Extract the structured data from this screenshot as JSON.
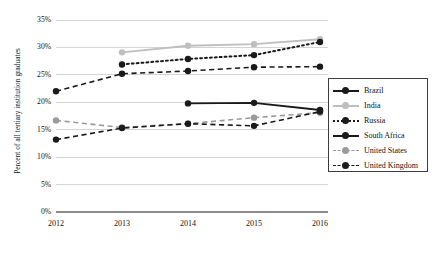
{
  "chart_data": {
    "type": "line",
    "title": "",
    "xlabel": "",
    "ylabel": "Percent of all tertiary institution graduates",
    "categories": [
      "2012",
      "2013",
      "2014",
      "2015",
      "2016"
    ],
    "ylim": [
      0,
      35
    ],
    "ytick_labels": [
      "0%",
      "5%",
      "10%",
      "15%",
      "20%",
      "25%",
      "30%",
      "35%"
    ],
    "ytick_values": [
      0,
      5,
      10,
      15,
      20,
      25,
      30,
      35
    ],
    "grid": true,
    "legend_position": "right",
    "series": [
      {
        "name": "Brazil",
        "color": "#1a1a1a",
        "style": "solid",
        "values": [
          null,
          null,
          null,
          null,
          18.5
        ]
      },
      {
        "name": "India",
        "color": "#bfbfbf",
        "style": "solid",
        "values": [
          null,
          29.1,
          30.3,
          30.6,
          31.5
        ]
      },
      {
        "name": "Russia",
        "color": "#1a1a1a",
        "style": "dotted",
        "values": [
          null,
          26.9,
          27.9,
          28.6,
          31.0
        ]
      },
      {
        "name": "South Africa",
        "color": "#1a1a1a",
        "style": "solid",
        "values": [
          null,
          null,
          19.8,
          19.9,
          18.6
        ]
      },
      {
        "name": "United States",
        "color": "#9a9a9a",
        "style": "dashed",
        "values": [
          16.7,
          15.4,
          16.1,
          17.2,
          18.1
        ]
      },
      {
        "name": "United Kingdom",
        "color": "#1a1a1a",
        "style": "dashed",
        "values": [
          22.0,
          25.2,
          25.7,
          26.4,
          26.5
        ]
      }
    ],
    "ukline2": {
      "name": "United Kingdom lower",
      "values": [
        13.2,
        15.3,
        16.1,
        15.7,
        18.3
      ]
    }
  },
  "legend": {
    "items": [
      {
        "label": "Brazil"
      },
      {
        "label": "India"
      },
      {
        "label": "Russia"
      },
      {
        "label": "South Africa"
      },
      {
        "label": "United States"
      },
      {
        "label": "United Kingdom"
      }
    ]
  }
}
